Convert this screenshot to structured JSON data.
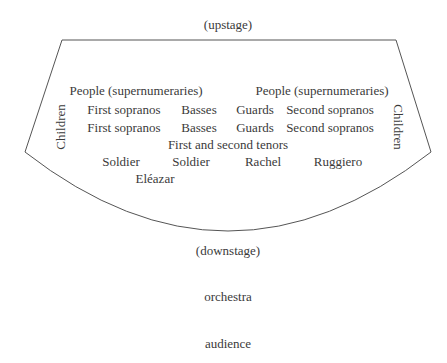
{
  "labels": {
    "upstage": "(upstage)",
    "downstage": "(downstage)",
    "orchestra": "orchestra",
    "audience": "audience"
  },
  "stage": {
    "children_left": "Children",
    "children_right": "Children",
    "row1": [
      "People (supernumeraries)",
      "People (supernumeraries)"
    ],
    "row2": [
      "First sopranos",
      "Basses",
      "Guards",
      "Second sopranos"
    ],
    "row3": [
      "First sopranos",
      "Basses",
      "Guards",
      "Second sopranos"
    ],
    "row4": [
      "First and second tenors"
    ],
    "row5": [
      "Soldier",
      "Soldier",
      "Rachel",
      "Ruggiero"
    ],
    "row6": [
      "Eléazar"
    ]
  },
  "colors": {
    "line": "#555555",
    "text": "#3a3a3a"
  }
}
